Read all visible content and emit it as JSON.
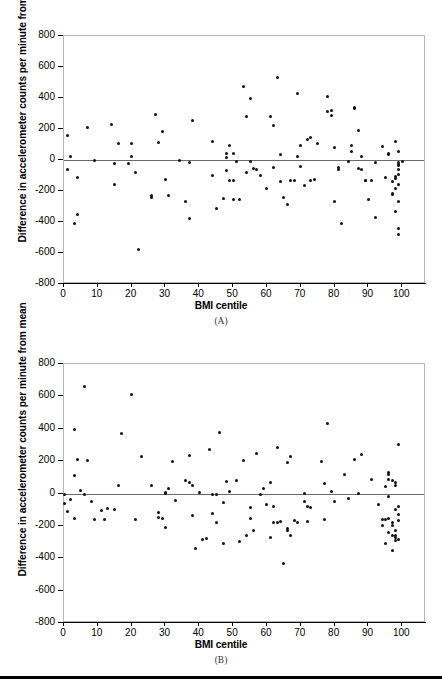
{
  "figure": {
    "panel_a_label": "(A)",
    "panel_b_label": "(B)"
  },
  "chart_data": [
    {
      "type": "scatter",
      "panel": "(A)",
      "title": "",
      "xlabel": "BMI centile",
      "ylabel": "Difference in accelerometer counts per minute from mean",
      "xlim": [
        0,
        107
      ],
      "ylim": [
        -800,
        800
      ],
      "xticks": [
        0,
        10,
        20,
        30,
        40,
        50,
        60,
        70,
        80,
        90,
        100
      ],
      "yticks": [
        -800,
        -600,
        -400,
        -200,
        0,
        200,
        400,
        600,
        800
      ],
      "xtick_labels": [
        "0",
        "10",
        "20",
        "30",
        "40",
        "50",
        "60",
        "70",
        "80",
        "90",
        "100"
      ],
      "ytick_labels": [
        "-800",
        "-600",
        "-400",
        "-200",
        "0",
        "200",
        "400",
        "600",
        "800"
      ],
      "grid": false,
      "legend": null,
      "reference_line_y": 0,
      "marker_color": "#111111",
      "points": [
        [
          1,
          160
        ],
        [
          1,
          -60
        ],
        [
          2,
          25
        ],
        [
          3,
          -410
        ],
        [
          4,
          -350
        ],
        [
          4,
          -115
        ],
        [
          7,
          207
        ],
        [
          9,
          -5
        ],
        [
          14,
          228
        ],
        [
          15,
          -25
        ],
        [
          15,
          -155
        ],
        [
          16,
          105
        ],
        [
          19,
          -20
        ],
        [
          20,
          105
        ],
        [
          20,
          20
        ],
        [
          21,
          -82
        ],
        [
          22,
          -580
        ],
        [
          26,
          -240
        ],
        [
          26,
          -232
        ],
        [
          27,
          292
        ],
        [
          28,
          111
        ],
        [
          29,
          183
        ],
        [
          30,
          -124
        ],
        [
          31,
          -227
        ],
        [
          34,
          -5
        ],
        [
          36,
          -268
        ],
        [
          37,
          -375
        ],
        [
          37,
          -14
        ],
        [
          38,
          253
        ],
        [
          44,
          117
        ],
        [
          44,
          -102
        ],
        [
          45,
          -310
        ],
        [
          47,
          -250
        ],
        [
          48,
          17
        ],
        [
          48,
          42
        ],
        [
          48,
          -70
        ],
        [
          49,
          92
        ],
        [
          49,
          -130
        ],
        [
          50,
          -130
        ],
        [
          50,
          45
        ],
        [
          50,
          -253
        ],
        [
          51,
          -8
        ],
        [
          52,
          -252
        ],
        [
          53,
          477
        ],
        [
          54,
          282
        ],
        [
          54,
          -80
        ],
        [
          55,
          395
        ],
        [
          55,
          -10
        ],
        [
          56,
          -53
        ],
        [
          57,
          -62
        ],
        [
          58,
          -102
        ],
        [
          60,
          -183
        ],
        [
          61,
          282
        ],
        [
          62,
          -50
        ],
        [
          62,
          224
        ],
        [
          63,
          532
        ],
        [
          64,
          36
        ],
        [
          64,
          -138
        ],
        [
          65,
          -240
        ],
        [
          66,
          -290
        ],
        [
          67,
          -130
        ],
        [
          68,
          -132
        ],
        [
          69,
          20
        ],
        [
          69,
          428
        ],
        [
          70,
          92
        ],
        [
          70,
          -45
        ],
        [
          71,
          -163
        ],
        [
          72,
          130
        ],
        [
          73,
          142
        ],
        [
          73,
          -130
        ],
        [
          74,
          -128
        ],
        [
          75,
          105
        ],
        [
          78,
          310
        ],
        [
          78,
          407
        ],
        [
          79,
          322
        ],
        [
          79,
          288
        ],
        [
          80,
          82
        ],
        [
          80,
          -265
        ],
        [
          81,
          -50
        ],
        [
          81,
          -60
        ],
        [
          82,
          -412
        ],
        [
          84,
          -12
        ],
        [
          85,
          57
        ],
        [
          85,
          95
        ],
        [
          86,
          335
        ],
        [
          86,
          340
        ],
        [
          87,
          188
        ],
        [
          87,
          -58
        ],
        [
          88,
          -62
        ],
        [
          88,
          25
        ],
        [
          89,
          -130
        ],
        [
          89,
          -133
        ],
        [
          90,
          -258
        ],
        [
          91,
          -130
        ],
        [
          92,
          -373
        ],
        [
          92,
          -18
        ],
        [
          94,
          88
        ],
        [
          95,
          -110
        ],
        [
          96,
          35
        ],
        [
          96,
          45
        ],
        [
          97,
          -225
        ],
        [
          97,
          -218
        ],
        [
          97,
          -140
        ],
        [
          98,
          -185
        ],
        [
          98,
          -120
        ],
        [
          98,
          -105
        ],
        [
          98,
          120
        ],
        [
          98,
          -330
        ],
        [
          99,
          58
        ],
        [
          99,
          -18
        ],
        [
          99,
          -28
        ],
        [
          99,
          -95
        ],
        [
          99,
          -155
        ],
        [
          99,
          -265
        ],
        [
          99,
          -440
        ],
        [
          99,
          -480
        ],
        [
          99,
          -60
        ],
        [
          99,
          -35
        ],
        [
          100,
          -10
        ]
      ]
    },
    {
      "type": "scatter",
      "panel": "(B)",
      "title": "",
      "xlabel": "BMI centile",
      "ylabel": "Difference in accelerometer counts per minute from mean",
      "xlim": [
        0,
        107
      ],
      "ylim": [
        -800,
        800
      ],
      "xticks": [
        0,
        10,
        20,
        30,
        40,
        50,
        60,
        70,
        80,
        90,
        100
      ],
      "yticks": [
        -800,
        -600,
        -400,
        -200,
        0,
        200,
        400,
        600,
        800
      ],
      "xtick_labels": [
        "0",
        "10",
        "20",
        "30",
        "40",
        "50",
        "60",
        "70",
        "80",
        "90",
        "100"
      ],
      "ytick_labels": [
        "-800",
        "-600",
        "-400",
        "-200",
        "0",
        "200",
        "400",
        "600",
        "800"
      ],
      "grid": false,
      "legend": null,
      "reference_line_y": 0,
      "marker_color": "#111111",
      "points": [
        [
          0,
          -5
        ],
        [
          0,
          -60
        ],
        [
          1,
          -110
        ],
        [
          2,
          -38
        ],
        [
          3,
          393
        ],
        [
          3,
          113
        ],
        [
          3,
          -155
        ],
        [
          4,
          207
        ],
        [
          5,
          20
        ],
        [
          6,
          660
        ],
        [
          6,
          -8
        ],
        [
          7,
          205
        ],
        [
          8,
          -52
        ],
        [
          9,
          -160
        ],
        [
          11,
          -105
        ],
        [
          12,
          -163
        ],
        [
          13,
          -92
        ],
        [
          15,
          -98
        ],
        [
          16,
          52
        ],
        [
          17,
          368
        ],
        [
          20,
          613
        ],
        [
          21,
          -158
        ],
        [
          23,
          228
        ],
        [
          26,
          48
        ],
        [
          28,
          -115
        ],
        [
          28,
          -148
        ],
        [
          29,
          -152
        ],
        [
          30,
          0
        ],
        [
          30,
          8
        ],
        [
          30,
          -210
        ],
        [
          31,
          30
        ],
        [
          32,
          196
        ],
        [
          33,
          -45
        ],
        [
          36,
          78
        ],
        [
          37,
          70
        ],
        [
          37,
          232
        ],
        [
          38,
          52
        ],
        [
          38,
          -138
        ],
        [
          39,
          -338
        ],
        [
          40,
          8
        ],
        [
          41,
          -283
        ],
        [
          42,
          -275
        ],
        [
          43,
          270
        ],
        [
          44,
          -122
        ],
        [
          44,
          -5
        ],
        [
          45,
          -8
        ],
        [
          45,
          -180
        ],
        [
          46,
          375
        ],
        [
          47,
          -58
        ],
        [
          47,
          -310
        ],
        [
          48,
          72
        ],
        [
          49,
          12
        ],
        [
          51,
          78
        ],
        [
          52,
          -297
        ],
        [
          53,
          205
        ],
        [
          54,
          -260
        ],
        [
          55,
          -155
        ],
        [
          55,
          -86
        ],
        [
          56,
          -228
        ],
        [
          57,
          248
        ],
        [
          58,
          -8
        ],
        [
          59,
          28
        ],
        [
          60,
          -70
        ],
        [
          61,
          65
        ],
        [
          61,
          -272
        ],
        [
          62,
          -180
        ],
        [
          62,
          -82
        ],
        [
          63,
          285
        ],
        [
          63,
          -178
        ],
        [
          64,
          -172
        ],
        [
          65,
          -435
        ],
        [
          66,
          193
        ],
        [
          66,
          -218
        ],
        [
          66,
          -228
        ],
        [
          67,
          230
        ],
        [
          67,
          -258
        ],
        [
          68,
          -165
        ],
        [
          69,
          -178
        ],
        [
          71,
          0
        ],
        [
          71,
          -48
        ],
        [
          72,
          -80
        ],
        [
          72,
          -172
        ],
        [
          73,
          -85
        ],
        [
          76,
          200
        ],
        [
          77,
          60
        ],
        [
          77,
          -160
        ],
        [
          78,
          432
        ],
        [
          79,
          10
        ],
        [
          80,
          -48
        ],
        [
          83,
          120
        ],
        [
          84,
          -32
        ],
        [
          86,
          210
        ],
        [
          87,
          0
        ],
        [
          88,
          242
        ],
        [
          91,
          85
        ],
        [
          93,
          -68
        ],
        [
          94,
          -160
        ],
        [
          94,
          -196
        ],
        [
          95,
          42
        ],
        [
          95,
          -308
        ],
        [
          95,
          -160
        ],
        [
          96,
          120
        ],
        [
          96,
          128
        ],
        [
          96,
          88
        ],
        [
          96,
          -20
        ],
        [
          96,
          -152
        ],
        [
          96,
          -238
        ],
        [
          97,
          78
        ],
        [
          97,
          -180
        ],
        [
          97,
          -195
        ],
        [
          97,
          -262
        ],
        [
          97,
          -355
        ],
        [
          98,
          50
        ],
        [
          98,
          68
        ],
        [
          98,
          -98
        ],
        [
          98,
          -272
        ],
        [
          98,
          -288
        ],
        [
          98,
          -228
        ],
        [
          98,
          -258
        ],
        [
          99,
          305
        ],
        [
          99,
          -78
        ],
        [
          99,
          -128
        ],
        [
          99,
          -165
        ],
        [
          99,
          -282
        ]
      ]
    }
  ]
}
